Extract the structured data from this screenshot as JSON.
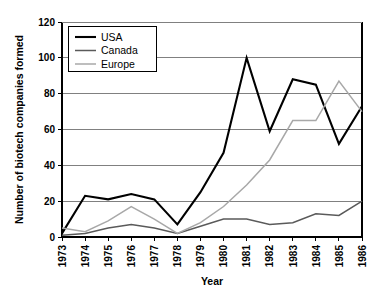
{
  "chart_data": {
    "type": "line",
    "title": "",
    "xlabel": "Year",
    "ylabel": "Number of biotech companies formed",
    "categories": [
      "1973",
      "1974",
      "1975",
      "1976",
      "1977",
      "1978",
      "1979",
      "1980",
      "1981",
      "1982",
      "1983",
      "1984",
      "1985",
      "1986"
    ],
    "x": [
      1973,
      1974,
      1975,
      1976,
      1977,
      1978,
      1979,
      1980,
      1981,
      1982,
      1983,
      1984,
      1985,
      1986
    ],
    "ylim": [
      0,
      120
    ],
    "yticks": [
      0,
      20,
      40,
      60,
      80,
      100,
      120
    ],
    "ytick_labels": [
      "0",
      "20",
      "40",
      "60",
      "80",
      "100",
      "120"
    ],
    "grid": true,
    "legend_position": "top-left",
    "series": [
      {
        "name": "USA",
        "color": "#000000",
        "width": 2.1,
        "values": [
          2,
          23,
          21,
          24,
          21,
          7,
          25,
          47,
          100,
          59,
          88,
          85,
          52,
          73
        ]
      },
      {
        "name": "Canada",
        "color": "#5a5a5a",
        "width": 1.5,
        "values": [
          1,
          2,
          5,
          7,
          5,
          2,
          6,
          10,
          10,
          7,
          8,
          13,
          12,
          20
        ]
      },
      {
        "name": "Europe",
        "color": "#a8a8a8",
        "width": 1.5,
        "values": [
          5,
          3,
          9,
          17,
          10,
          2,
          8,
          17,
          29,
          43,
          65,
          65,
          87,
          70
        ]
      }
    ]
  },
  "legend": {
    "entries": [
      "USA",
      "Canada",
      "Europe"
    ]
  }
}
